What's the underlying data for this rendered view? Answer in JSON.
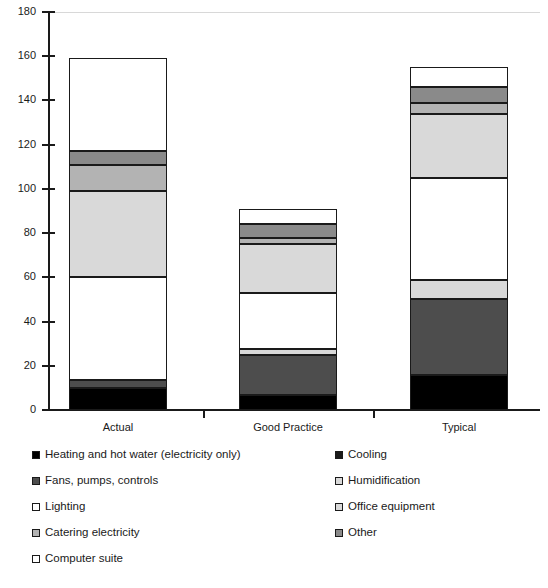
{
  "chart_data": {
    "type": "bar",
    "subtype": "stacked-column",
    "title": "",
    "xlabel": "",
    "ylabel": "",
    "ylim": [
      0,
      180
    ],
    "ytick_step": 20,
    "yticks": [
      0,
      20,
      40,
      60,
      80,
      100,
      120,
      140,
      160,
      180
    ],
    "ytick_labels": [
      "0",
      "20",
      "40",
      "60",
      "80",
      "100",
      "120",
      "140",
      "160",
      "180"
    ],
    "grid": false,
    "legend_position": "below",
    "categories": [
      "Actual",
      "Good Practice",
      "Typical"
    ],
    "series": [
      {
        "name": "Heating and hot water (electricity only)",
        "color": "#000000",
        "values": [
          10,
          7,
          16
        ]
      },
      {
        "name": "Fans, pumps, controls",
        "color": "#4d4d4d",
        "values": [
          3.5,
          18,
          34
        ]
      },
      {
        "name": "Humidification",
        "color": "#d9d9d9",
        "values": [
          0,
          2.5,
          9
        ]
      },
      {
        "name": "Lighting",
        "color": "#ffffff",
        "values": [
          46.5,
          25.5,
          46
        ]
      },
      {
        "name": "Office equipment",
        "color": "#d9d9d9",
        "values": [
          39,
          22,
          29
        ]
      },
      {
        "name": "Catering electricity",
        "color": "#b3b3b3",
        "values": [
          12,
          3,
          5
        ]
      },
      {
        "name": "Other",
        "color": "#8a8a8a",
        "values": [
          6,
          6,
          7
        ]
      },
      {
        "name": "Computer suite",
        "color": "#ffffff",
        "values": [
          42,
          7,
          9
        ]
      }
    ],
    "totals": [
      159,
      91,
      155
    ]
  },
  "legend": {
    "items": [
      {
        "label": "Heating and hot water (electricity only)",
        "swatch": "#000000"
      },
      {
        "label": "Cooling",
        "swatch": "#1a1a1a"
      },
      {
        "label": "Fans, pumps, controls",
        "swatch": "#4d4d4d"
      },
      {
        "label": "Humidification",
        "swatch": "#d9d9d9"
      },
      {
        "label": "Lighting",
        "swatch": "#ffffff"
      },
      {
        "label": "Office equipment",
        "swatch": "#d9d9d9"
      },
      {
        "label": "Catering electricity",
        "swatch": "#b3b3b3"
      },
      {
        "label": "Other",
        "swatch": "#8a8a8a"
      },
      {
        "label": "Computer suite",
        "swatch": "#ffffff"
      }
    ]
  }
}
